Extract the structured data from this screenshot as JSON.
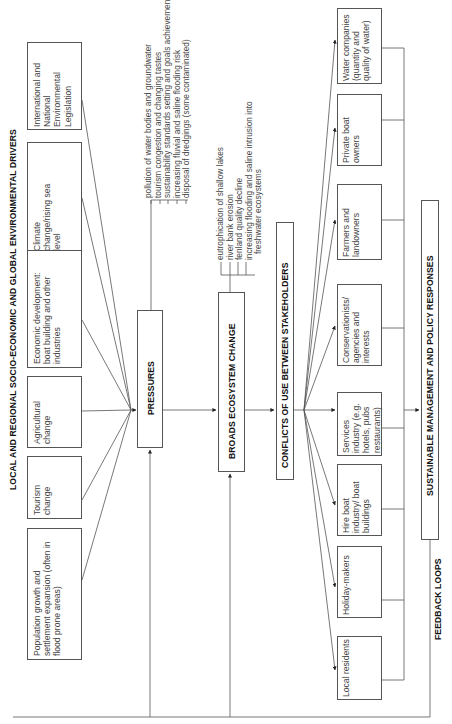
{
  "header": {
    "title": "LOCAL AND REGIONAL SOCIO-ECONOMIC AND GLOBAL ENVIRONMENTAL DRIVERS"
  },
  "drivers": [
    {
      "label": "International and National Environmental Legislation"
    },
    {
      "label": "Climate change/rising sea level"
    },
    {
      "label": "Economic development: boat building and other industries"
    },
    {
      "label": "Agricultural change"
    },
    {
      "label": "Tourism change"
    },
    {
      "label": "Population growth and settlement expansion (often in flood prone areas)"
    }
  ],
  "pressures": {
    "title": "PRESSURES",
    "items": [
      "pollution of water bodies and groundwater",
      "tourism congestion and changing tastes",
      "sustainability standards setting and goals achievement",
      "increasing fluvial and saline flooding risk",
      "disposal of dredgings (some contaminated)"
    ]
  },
  "ecosystem": {
    "title": "BROADS ECOSYSTEM CHANGE",
    "items": [
      "eutrophication of shallow lakes",
      "river bank erosion",
      "fenland quality decline",
      "increasing flooding and saline intrusion into",
      "freshwater ecosystems"
    ]
  },
  "conflicts": {
    "title": "CONFLICTS OF USE BETWEEN STAKEHOLDERS"
  },
  "stakeholders": [
    {
      "label": "Water companies (quantity and quality of water)"
    },
    {
      "label": "Private boat owners"
    },
    {
      "label": "Farmers and landowners"
    },
    {
      "label": "Conservationists/ agencies and interests"
    },
    {
      "label": "Services industry (e.g. hotels, pubs restaurants)"
    },
    {
      "label": "Hire boat industry/ boat buildings"
    },
    {
      "label": "Holiday-makers"
    },
    {
      "label": "Local residents"
    }
  ],
  "responses": {
    "title": "SUSTAINABLE MANAGEMENT AND POLICY RESPONSES"
  },
  "feedback": {
    "label": "FEEDBACK LOOPS"
  },
  "colors": {
    "line": "#555555",
    "text": "#444444",
    "heading": "#111111"
  }
}
